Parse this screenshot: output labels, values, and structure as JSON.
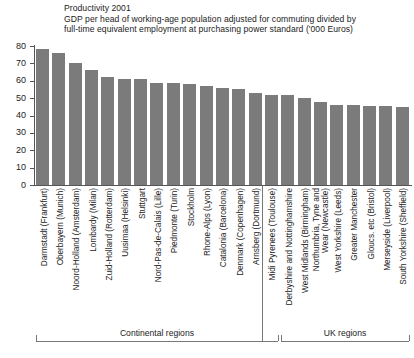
{
  "chart_data": {
    "type": "bar",
    "title": "Productivity 2001",
    "subtitle_lines": [
      "Productivity 2001",
      "GDP per head of working-age population adjusted for commuting divided by",
      "full-time equivalent employment at purchasing power standard ('000 Euros)"
    ],
    "xlabel": "",
    "ylabel": "",
    "ylim": [
      0,
      80
    ],
    "ytick_labels": [
      "80",
      "70",
      "60",
      "50",
      "40",
      "30",
      "20",
      "10",
      "0"
    ],
    "ytick_values": [
      80,
      70,
      60,
      50,
      40,
      30,
      20,
      10,
      0
    ],
    "grid": false,
    "legend": "none",
    "bar_color": "#7b7b7b",
    "axis_color": "#555555",
    "categories": [
      "Darmstadt (Frankfurt)",
      "Oberbayern (Munich)",
      "Noord-Holland (Amsterdam)",
      "Lombardy (Milan)",
      "Zuid-Holland (Rotterdam)",
      "Uusimaa (Helsinki)",
      "Stuttgart",
      "Nord-Pas-de-Calais (Lille)",
      "Piedmonte (Turin)",
      "Stockholm",
      "Rhone-Alps (Lyon)",
      "Catalonia (Barcelona)",
      "Denmark (Copenhagen)",
      "Arnsberg (Dortmund)",
      "Midi Pyrenees (Toulouse)",
      "Derbyshire and Nottinghamshire",
      "West Midlands (Birmingham)",
      "Northumbria, Tyne and Wear (Newcastle)",
      "West Yorkshire (Leeds)",
      "Greater Manchester",
      "Gloucs. etc (Bristol)",
      "Merseyside (Liverpool)",
      "South Yorkshire (Sheffield)"
    ],
    "values": [
      78,
      76,
      70,
      66,
      62,
      61,
      61,
      59,
      59,
      58,
      57,
      56,
      55,
      53,
      52,
      52,
      50,
      48,
      46,
      46,
      45.5,
      45.5,
      45
    ],
    "groups": [
      {
        "label": "Continental regions",
        "start_index": 0,
        "end_index": 14
      },
      {
        "label": "UK regions",
        "start_index": 15,
        "end_index": 22
      }
    ]
  },
  "category_label_lines": [
    [
      "Darmstadt (Frankfurt)"
    ],
    [
      "Oberbayern (Munich)"
    ],
    [
      "Noord-Holland (Amsterdam)"
    ],
    [
      "Lombardy (Milan)"
    ],
    [
      "Zuid-Holland (Rotterdam)"
    ],
    [
      "Uusimaa (Helsinki)"
    ],
    [
      "Stuttgart"
    ],
    [
      "Nord-Pas-de-Calais (Lille)"
    ],
    [
      "Piedmonte (Turin)"
    ],
    [
      "Stockholm"
    ],
    [
      "Rhone-Alps (Lyon)"
    ],
    [
      "Catalonia (Barcelona)"
    ],
    [
      "Denmark (Copenhagen)"
    ],
    [
      "Arnsberg (Dortmund)"
    ],
    [
      "Midi Pyrenees (Toulouse)"
    ],
    [
      "Derbyshire and Nottinghamshire"
    ],
    [
      "West Midlands (Birmingham)"
    ],
    [
      "Northumbria, Tyne and",
      "Wear (Newcastle)"
    ],
    [
      "West Yorkshire (Leeds)"
    ],
    [
      "Greater Manchester"
    ],
    [
      "Gloucs. etc (Bristol)"
    ],
    [
      "Merseyside (Liverpool)"
    ],
    [
      "South Yorkshire (Sheffield)"
    ]
  ]
}
